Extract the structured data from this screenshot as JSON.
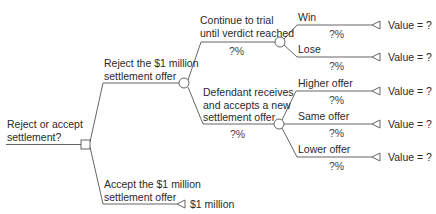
{
  "root": {
    "label_line1": "Reject or accept",
    "label_line2": "settlement?"
  },
  "reject": {
    "label_line1": "Reject the $1 million",
    "label_line2": "settlement offer",
    "trial": {
      "label_line1": "Continue to trial",
      "label_line2": "until verdict reached",
      "prob": "?%",
      "outcomes": [
        {
          "label": "Win",
          "prob": "?%",
          "value": "Value = ?"
        },
        {
          "label": "Lose",
          "prob": "?%",
          "value": "Value = ?"
        }
      ]
    },
    "new_offer": {
      "label_line1": "Defendant receives",
      "label_line2": "and accepts a new",
      "label_line3": "settlement offer",
      "prob": "?%",
      "outcomes": [
        {
          "label": "Higher offer",
          "prob": "?%",
          "value": "Value = ?"
        },
        {
          "label": "Same offer",
          "prob": "?%",
          "value": "Value = ?"
        },
        {
          "label": "Lower offer",
          "prob": "?%",
          "value": "Value = ?"
        }
      ]
    }
  },
  "accept": {
    "label_line1": "Accept the $1 million",
    "label_line2": "settlement offer",
    "value": "$1 million"
  },
  "colors": {
    "line": "#555555",
    "text": "#2a2a2a"
  }
}
